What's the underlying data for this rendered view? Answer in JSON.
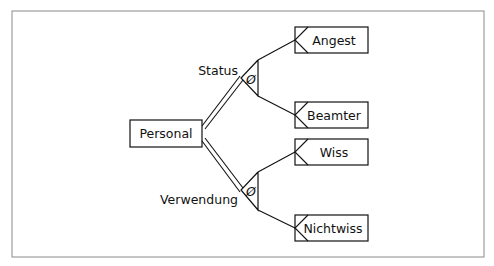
{
  "diagram": {
    "type": "er-generalization",
    "root": {
      "label": "Personal"
    },
    "specializations": [
      {
        "label": "Status",
        "symbol": "Ø",
        "children": [
          {
            "label": "Angest"
          },
          {
            "label": "Beamter"
          }
        ]
      },
      {
        "label": "Verwendung",
        "symbol": "Ø",
        "children": [
          {
            "label": "Wiss"
          },
          {
            "label": "Nichtwiss"
          }
        ]
      }
    ],
    "colors": {
      "line": "#111111",
      "frame": "#888888",
      "background": "#ffffff"
    }
  }
}
